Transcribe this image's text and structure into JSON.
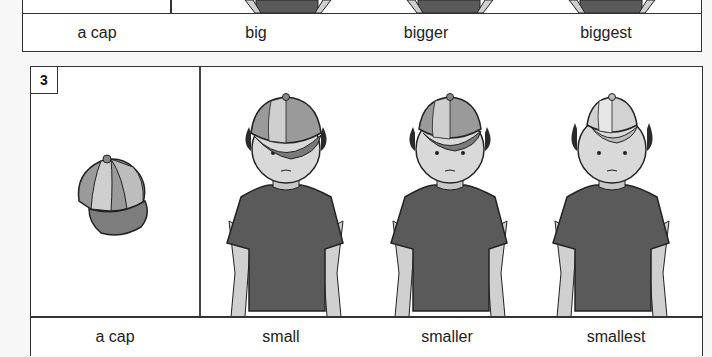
{
  "panel_2": {
    "labels": [
      "a cap",
      "big",
      "bigger",
      "biggest"
    ]
  },
  "panel_3": {
    "number": "3",
    "labels": [
      "a cap",
      "small",
      "smaller",
      "smallest"
    ],
    "images": [
      {
        "subject": "cap-icon",
        "description": "a multicolored paneled cap"
      },
      {
        "subject": "boy-small-cap",
        "description": "boy wearing a cap that is too small"
      },
      {
        "subject": "boy-smaller-cap",
        "description": "boy wearing a smaller cap"
      },
      {
        "subject": "boy-smallest-cap",
        "description": "boy wearing the smallest cap"
      }
    ]
  },
  "colors": {
    "shirt": "#5a5a5a",
    "skin": "#d9d9d9",
    "hair": "#2a2a2a",
    "cap_dark": "#7a7a7a",
    "cap_light": "#c4c4c4",
    "border": "#333333"
  }
}
